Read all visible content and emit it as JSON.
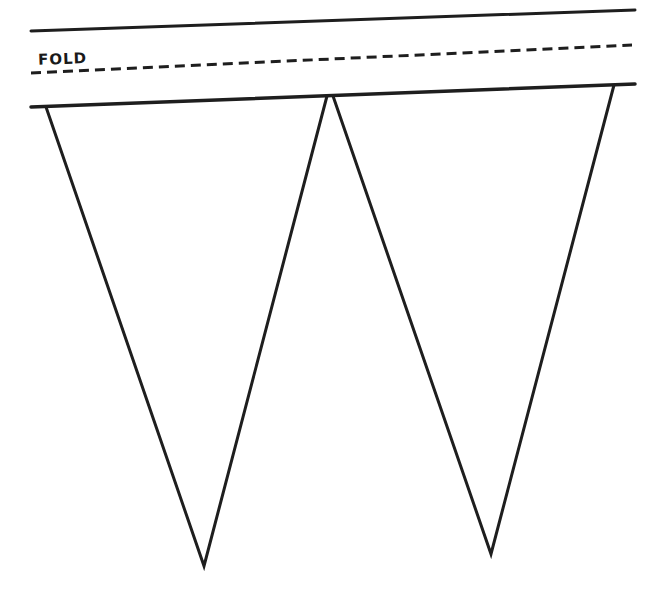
{
  "template": {
    "fold_label": "FOLD",
    "stroke_color": "#1e1e1e",
    "background": "#ffffff"
  },
  "band": {
    "top_line": [
      31,
      31,
      635,
      10
    ],
    "fold_line": [
      31,
      73,
      632,
      45
    ],
    "bottom_line": [
      31,
      107,
      635,
      84
    ]
  },
  "pennants": [
    {
      "left": [
        46,
        107
      ],
      "right": [
        327,
        96
      ],
      "apex": [
        204,
        566
      ]
    },
    {
      "left": [
        333,
        96
      ],
      "right": [
        614,
        85
      ],
      "apex": [
        491,
        554
      ]
    }
  ]
}
